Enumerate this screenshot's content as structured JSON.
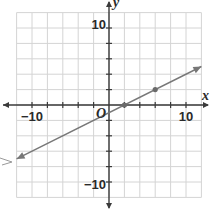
{
  "chart_data": {
    "type": "line",
    "title": "",
    "xlabel": "x",
    "ylabel": "y",
    "origin_label": "O",
    "xlim": [
      -12,
      12
    ],
    "ylim": [
      -12,
      12
    ],
    "grid": true,
    "grid_step": 2,
    "x_tick_labels": [
      {
        "value": -10,
        "label": "−10"
      },
      {
        "value": 10,
        "label": "10"
      }
    ],
    "y_tick_labels": [
      {
        "value": 10,
        "label": "10"
      },
      {
        "value": -10,
        "label": "−10"
      }
    ],
    "series": [
      {
        "name": "line",
        "slope": 0.5,
        "intercept": -1,
        "x": [
          -12,
          12
        ],
        "y": [
          -7,
          5
        ],
        "arrows": "both",
        "marked_points": [
          {
            "x": 2,
            "y": 0
          },
          {
            "x": 6,
            "y": 2
          }
        ]
      }
    ],
    "colors": {
      "grid": "#d4d4d4",
      "axis": "#3a3a3a",
      "line": "#777777",
      "point": "#6a6a6a"
    }
  }
}
